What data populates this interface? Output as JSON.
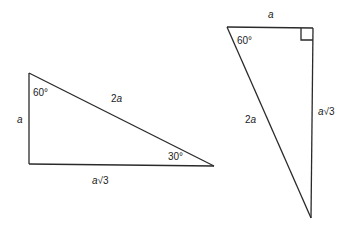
{
  "diagram": {
    "triangles": [
      {
        "id": "left",
        "angles": [
          "60°",
          "30°"
        ],
        "sides": {
          "short_leg": "a",
          "hypotenuse": "2a",
          "long_leg": "a√3"
        }
      },
      {
        "id": "right",
        "angles": [
          "60°"
        ],
        "right_angle_marker": true,
        "sides": {
          "short_leg": "a",
          "hypotenuse": "2a",
          "long_leg": "a√3"
        }
      }
    ]
  },
  "labels": {
    "left": {
      "angle_60": "60°",
      "angle_30": "30°",
      "short_leg": "a",
      "hypotenuse_coef": "2",
      "hypotenuse_var": "a",
      "long_leg_var": "a",
      "long_leg_root": "√3"
    },
    "right": {
      "angle_60": "60°",
      "short_leg": "a",
      "hypotenuse_coef": "2",
      "hypotenuse_var": "a",
      "long_leg_var": "a",
      "long_leg_root": "√3"
    }
  }
}
